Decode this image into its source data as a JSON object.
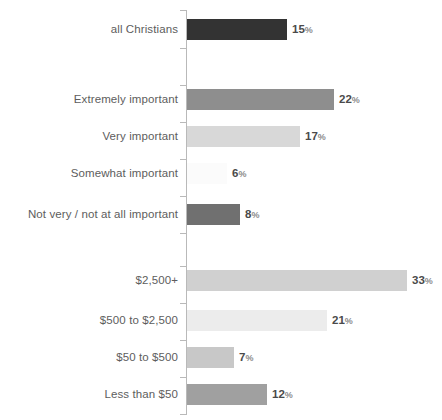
{
  "chart_data": {
    "type": "bar",
    "orientation": "horizontal",
    "title": "",
    "subtitle": "",
    "xlabel": "",
    "ylabel": "",
    "xlim": [
      0,
      38
    ],
    "grid": false,
    "legend": null,
    "value_suffix": "%",
    "axis_color": "#b9b9b9",
    "label_color": "#5d5d5d",
    "value_color": "#4a4a4a",
    "categories": [
      "all Christians",
      "Extremely important",
      "Very important",
      "Somewhat important",
      "Not very / not at all important",
      "$2,500+",
      "$500 to $2,500",
      "$50 to $500",
      "Less than $50"
    ],
    "values": [
      15,
      22,
      17,
      6,
      8,
      33,
      21,
      7,
      12
    ],
    "value_labels": [
      "15",
      "22",
      "17",
      "6",
      "8",
      "33",
      "21",
      "7",
      "12"
    ],
    "bar_colors": [
      "#333333",
      "#8e8e8e",
      "#d8d8d8",
      "#fbfbfb",
      "#707070",
      "#d0d0d0",
      "#ececec",
      "#c8c8c8",
      "#a0a0a0"
    ],
    "groups": [
      {
        "name": "overall",
        "categories": [
          "all Christians"
        ]
      },
      {
        "name": "importance-of-religion",
        "categories": [
          "Extremely important",
          "Very important",
          "Somewhat important",
          "Not very / not at all important"
        ]
      },
      {
        "name": "donation-amount",
        "categories": [
          "$2,500+",
          "$500 to $2,500",
          "$50 to $500",
          "Less than $50"
        ]
      }
    ],
    "rows": [
      {
        "label": "all Christians",
        "value": 15,
        "value_label": "15",
        "color": "#333333",
        "top": 19,
        "bar_width": 100
      },
      {
        "label": "Extremely important",
        "value": 22,
        "value_label": "22",
        "color": "#8e8e8e",
        "top": 89,
        "bar_width": 147
      },
      {
        "label": "Very important",
        "value": 17,
        "value_label": "17",
        "color": "#d8d8d8",
        "top": 126,
        "bar_width": 113
      },
      {
        "label": "Somewhat important",
        "value": 6,
        "value_label": "6",
        "color": "#fbfbfb",
        "top": 163,
        "bar_width": 40
      },
      {
        "label": "Not very / not at all important",
        "value": 8,
        "value_label": "8",
        "color": "#707070",
        "top": 204,
        "bar_width": 53
      },
      {
        "label": "$2,500+",
        "value": 33,
        "value_label": "33",
        "color": "#d0d0d0",
        "top": 270,
        "bar_width": 220
      },
      {
        "label": "$500 to $2,500",
        "value": 21,
        "value_label": "21",
        "color": "#ececec",
        "top": 310,
        "bar_width": 140
      },
      {
        "label": "$50 to $500",
        "value": 7,
        "value_label": "7",
        "color": "#c8c8c8",
        "top": 347,
        "bar_width": 47
      },
      {
        "label": "Less than $50",
        "value": 12,
        "value_label": "12",
        "color": "#a0a0a0",
        "top": 384,
        "bar_width": 80
      }
    ],
    "axis_ticks_y": [
      10,
      48,
      85,
      122,
      159,
      196,
      233,
      266,
      303,
      340,
      377,
      414
    ]
  }
}
